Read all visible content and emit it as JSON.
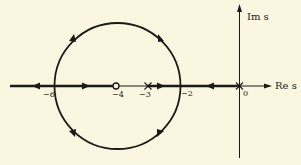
{
  "diagram": {
    "type": "root-locus",
    "background": "#fbf6df",
    "ink": "#1a1a1a",
    "axes": {
      "real_label": "Re s",
      "imag_label": "Im s"
    },
    "tick_labels": [
      "−6",
      "−4",
      "−3",
      "−2",
      "0"
    ],
    "poles": [
      0,
      -3
    ],
    "zeros": [
      -4
    ],
    "breakpoints": [
      -6,
      -2
    ],
    "circle": {
      "center": -4,
      "radius": 2
    }
  }
}
